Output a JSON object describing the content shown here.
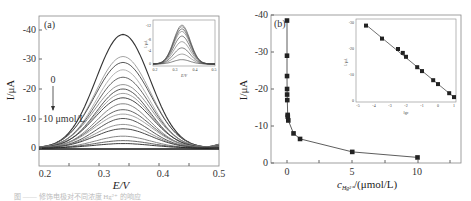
{
  "chart_data": [
    {
      "panel": "(a)",
      "type": "line",
      "title": "",
      "xlabel": "E/V",
      "ylabel": "I/μA",
      "xlim": [
        0.2,
        0.5
      ],
      "ylim": [
        5,
        -45
      ],
      "x_ticks": [
        "0.2",
        "0.3",
        "0.4",
        "0.5"
      ],
      "y_ticks": [
        "0",
        "-10",
        "-20",
        "-30",
        "-40"
      ],
      "annotations": [
        "0",
        "10 μmol/L"
      ],
      "grid": false,
      "peak_potential": 0.34,
      "series_peak_currents": [
        -38.5,
        -31,
        -29,
        -26.5,
        -24,
        -21.5,
        -20,
        -18.5,
        -17,
        -15,
        -13,
        -11.5,
        -10,
        -8,
        -6.5,
        -4,
        -2.5,
        -1.5
      ],
      "inset": {
        "type": "line",
        "xlabel": "E/V",
        "ylabel": "I/μA",
        "x_ticks": [
          "0.2",
          "0.3",
          "0.4",
          "0.5"
        ],
        "y_ticks": [
          "0",
          "-4",
          "-8",
          "-12"
        ],
        "series_peak_currents": [
          -12.5,
          -12,
          -11.3,
          -10.5,
          -9,
          -7.2,
          -5.2,
          -3.2,
          -1.4
        ]
      }
    },
    {
      "panel": "(b)",
      "type": "scatter",
      "title": "",
      "xlabel": "c_Hg2+/(μmol/L)",
      "ylabel": "I/μA",
      "xlim": [
        -1,
        11
      ],
      "ylim": [
        0,
        -40
      ],
      "x_ticks": [
        "0",
        "5",
        "10"
      ],
      "y_ticks": [
        "0",
        "-10",
        "-20",
        "-30",
        "-40"
      ],
      "grid": false,
      "x": [
        3e-05,
        0.0003,
        0.003,
        0.006,
        0.01,
        0.02,
        0.05,
        0.06,
        0.1,
        0.5,
        1,
        5,
        10
      ],
      "y": [
        -38.5,
        -29,
        -23.5,
        -20,
        -18.5,
        -17,
        -13,
        -12.5,
        -11.5,
        -8,
        -6.5,
        -3,
        -1.5
      ],
      "fit": "curve",
      "inset": {
        "type": "scatter",
        "xlabel": "lg c_Hg2+",
        "ylabel": "I/μA",
        "x_ticks": [
          "-5",
          "-4",
          "-3",
          "-2",
          "-1",
          "0",
          "1"
        ],
        "y_ticks": [
          "0",
          "-10",
          "-20",
          "-30"
        ],
        "x": [
          -4.5,
          -3.5,
          -2.5,
          -2.2,
          -2.0,
          -1.3,
          -1.0,
          -0.3,
          0.0,
          0.7,
          1.0
        ],
        "y": [
          -29,
          -24,
          -20,
          -18.5,
          -17,
          -13,
          -11.5,
          -8,
          -6.5,
          -3,
          -1.5
        ],
        "fit": "linear"
      }
    }
  ],
  "labels": {
    "a_panel": "(a)",
    "b_panel": "(b)",
    "a_xlabel": "E/V",
    "a_ylabel": "I/μA",
    "b_xlabel": "c",
    "b_xlabel_sub": "Hg²⁺",
    "b_xlabel_unit": "/(μmol/L)",
    "b_ylabel": "I/μA",
    "arrow_start": "0",
    "arrow_end": "10 μmol/L",
    "inset_a_xlabel": "E/V",
    "inset_a_ylabel": "I/μA",
    "inset_b_xlabel": "lgc",
    "inset_b_ylabel": "I/μA",
    "caption": "图 —— 修饰电极对不同浓度 Hg²⁺ 的响应"
  }
}
